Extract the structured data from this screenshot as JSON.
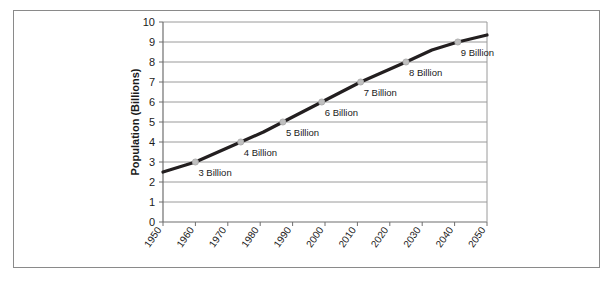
{
  "chart_data": {
    "type": "line",
    "title": "",
    "xlabel": "",
    "ylabel": "Population (Billions)",
    "xlim": [
      1950,
      2050
    ],
    "ylim": [
      0,
      10
    ],
    "grid": true,
    "legend": "none",
    "x_ticks": [
      "1950",
      "1960",
      "1970",
      "1980",
      "1990",
      "2000",
      "2010",
      "2020",
      "2030",
      "2040",
      "2050"
    ],
    "y_ticks": [
      "0",
      "1",
      "2",
      "3",
      "4",
      "5",
      "6",
      "7",
      "8",
      "9",
      "10"
    ],
    "series": [
      {
        "name": "World Population",
        "color": "#231f20",
        "marker_color": "#bfbfbf",
        "x": [
          1950,
          1955,
          1960,
          1967,
          1974,
          1981,
          1987,
          1993,
          1999,
          2005,
          2011,
          2018,
          2025,
          2033,
          2041,
          2050
        ],
        "values": [
          2.5,
          2.75,
          3.0,
          3.5,
          4.0,
          4.5,
          5.0,
          5.5,
          6.0,
          6.5,
          7.0,
          7.5,
          8.0,
          8.6,
          9.0,
          9.35
        ]
      }
    ],
    "annotations": [
      {
        "label": "3 Billion",
        "x": 1960,
        "y": 3
      },
      {
        "label": "4 Billion",
        "x": 1974,
        "y": 4
      },
      {
        "label": "5 Billion",
        "x": 1987,
        "y": 5
      },
      {
        "label": "6 Billion",
        "x": 1999,
        "y": 6
      },
      {
        "label": "7 Billion",
        "x": 2011,
        "y": 7
      },
      {
        "label": "8 Billion",
        "x": 2025,
        "y": 8
      },
      {
        "label": "9 Billion",
        "x": 2041,
        "y": 9
      }
    ],
    "colors": {
      "line": "#231f20",
      "marker": "#bfbfbf",
      "grid": "#9a9a9a",
      "axis": "#6f6f6f",
      "frame": "#8a8a8a",
      "text": "#1a1a1a",
      "background": "#ffffff"
    }
  }
}
